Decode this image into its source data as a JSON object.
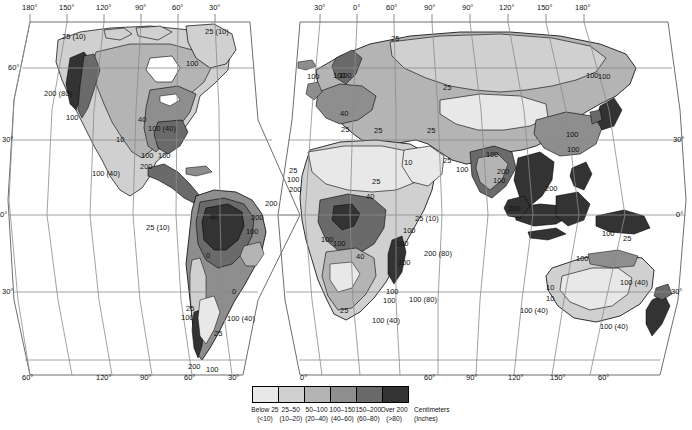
{
  "map": {
    "title": "World Average Annual Precipitation",
    "projection": "interrupted-goode-homolosine",
    "frame_color": "#7a7a7a",
    "graticule_color": "#8a8a8a",
    "coast_color": "#000000",
    "background": "#ffffff"
  },
  "graticule": {
    "top_left_lon": [
      "180°",
      "150°",
      "120°",
      "90°",
      "60°",
      "30°"
    ],
    "top_right_lon": [
      "30°",
      "0°",
      "60°",
      "90°",
      "90°",
      "120°",
      "150°",
      "180°"
    ],
    "bottom_left_lon": [
      "60°",
      "120°",
      "90°",
      "60°",
      "30°",
      "0°"
    ],
    "bottom_right_lon": [
      "60°",
      "90°",
      "120°",
      "150°",
      "60°"
    ],
    "left_lat": [
      "60°",
      "30°",
      "0°",
      "30°",
      "60°"
    ],
    "right_lat": [
      "30°",
      "0°",
      "30°"
    ]
  },
  "contour_labels": [
    {
      "text": "25 (10)",
      "x": 62,
      "y": 33
    },
    {
      "text": "25 (10)",
      "x": 205,
      "y": 28
    },
    {
      "text": "100",
      "x": 186,
      "y": 60
    },
    {
      "text": "200 (80)",
      "x": 44,
      "y": 90
    },
    {
      "text": "100",
      "x": 66,
      "y": 114
    },
    {
      "text": "40",
      "x": 138,
      "y": 116
    },
    {
      "text": "10",
      "x": 116,
      "y": 136
    },
    {
      "text": "100 (40)",
      "x": 148,
      "y": 125
    },
    {
      "text": "100",
      "x": 141,
      "y": 152
    },
    {
      "text": "200",
      "x": 140,
      "y": 163
    },
    {
      "text": "100",
      "x": 158,
      "y": 152
    },
    {
      "text": "100 (40)",
      "x": 92,
      "y": 170
    },
    {
      "text": "25 (10)",
      "x": 146,
      "y": 224
    },
    {
      "text": "80",
      "x": 210,
      "y": 213
    },
    {
      "text": "200",
      "x": 251,
      "y": 214
    },
    {
      "text": "100",
      "x": 246,
      "y": 228
    },
    {
      "text": "0",
      "x": 206,
      "y": 252
    },
    {
      "text": "0",
      "x": 232,
      "y": 288
    },
    {
      "text": "25",
      "x": 186,
      "y": 305
    },
    {
      "text": "100",
      "x": 181,
      "y": 314
    },
    {
      "text": "100 (40)",
      "x": 227,
      "y": 315
    },
    {
      "text": "25",
      "x": 214,
      "y": 330
    },
    {
      "text": "200",
      "x": 188,
      "y": 363
    },
    {
      "text": "100",
      "x": 206,
      "y": 366
    },
    {
      "text": "25",
      "x": 391,
      "y": 35
    },
    {
      "text": "100",
      "x": 333,
      "y": 72
    },
    {
      "text": "100",
      "x": 339,
      "y": 72
    },
    {
      "text": "100",
      "x": 307,
      "y": 73
    },
    {
      "text": "25",
      "x": 443,
      "y": 84
    },
    {
      "text": "40",
      "x": 340,
      "y": 110
    },
    {
      "text": "25",
      "x": 341,
      "y": 126
    },
    {
      "text": "25",
      "x": 374,
      "y": 127
    },
    {
      "text": "25",
      "x": 427,
      "y": 127
    },
    {
      "text": "25",
      "x": 443,
      "y": 157
    },
    {
      "text": "100",
      "x": 456,
      "y": 166
    },
    {
      "text": "10",
      "x": 404,
      "y": 159
    },
    {
      "text": "25",
      "x": 372,
      "y": 178
    },
    {
      "text": "25",
      "x": 289,
      "y": 167
    },
    {
      "text": "100",
      "x": 287,
      "y": 176
    },
    {
      "text": "200",
      "x": 289,
      "y": 186
    },
    {
      "text": "200",
      "x": 265,
      "y": 200
    },
    {
      "text": "100",
      "x": 321,
      "y": 236
    },
    {
      "text": "100",
      "x": 333,
      "y": 240
    },
    {
      "text": "40",
      "x": 366,
      "y": 193
    },
    {
      "text": "25 (10)",
      "x": 415,
      "y": 215
    },
    {
      "text": "100",
      "x": 403,
      "y": 227
    },
    {
      "text": "100",
      "x": 396,
      "y": 240
    },
    {
      "text": "200 (80)",
      "x": 424,
      "y": 250
    },
    {
      "text": "100",
      "x": 398,
      "y": 259
    },
    {
      "text": "40",
      "x": 356,
      "y": 253
    },
    {
      "text": "100",
      "x": 386,
      "y": 288
    },
    {
      "text": "100",
      "x": 383,
      "y": 297
    },
    {
      "text": "100 (80)",
      "x": 409,
      "y": 296
    },
    {
      "text": "25",
      "x": 340,
      "y": 307
    },
    {
      "text": "100 (40)",
      "x": 372,
      "y": 317
    },
    {
      "text": "100",
      "x": 586,
      "y": 72
    },
    {
      "text": "100",
      "x": 598,
      "y": 73
    },
    {
      "text": "100",
      "x": 566,
      "y": 131
    },
    {
      "text": "100",
      "x": 567,
      "y": 146
    },
    {
      "text": "100",
      "x": 486,
      "y": 151
    },
    {
      "text": "200",
      "x": 497,
      "y": 168
    },
    {
      "text": "100",
      "x": 493,
      "y": 177
    },
    {
      "text": "200",
      "x": 545,
      "y": 185
    },
    {
      "text": "200",
      "x": 508,
      "y": 205
    },
    {
      "text": "100",
      "x": 602,
      "y": 230
    },
    {
      "text": "25",
      "x": 623,
      "y": 235
    },
    {
      "text": "100",
      "x": 576,
      "y": 255
    },
    {
      "text": "10",
      "x": 546,
      "y": 284
    },
    {
      "text": "10",
      "x": 546,
      "y": 295
    },
    {
      "text": "100 (40)",
      "x": 620,
      "y": 279
    },
    {
      "text": "100 (40)",
      "x": 520,
      "y": 307
    },
    {
      "text": "100 (40)",
      "x": 600,
      "y": 323
    }
  ],
  "legend": {
    "classes": [
      {
        "range_cm": "Below 25",
        "range_in": "(<10)",
        "color": "#e8e8e8"
      },
      {
        "range_cm": "25–50",
        "range_in": "(10–20)",
        "color": "#d0d0d0"
      },
      {
        "range_cm": "50–100",
        "range_in": "(20–40)",
        "color": "#b4b4b4"
      },
      {
        "range_cm": "100–150",
        "range_in": "(40–60)",
        "color": "#8e8e8e"
      },
      {
        "range_cm": "150–200",
        "range_in": "(60–80)",
        "color": "#6a6a6a"
      },
      {
        "range_cm": "Over 200",
        "range_in": "(>80)",
        "color": "#333333"
      }
    ],
    "unit_primary": "Centimeters",
    "unit_secondary": "(Inches)"
  },
  "chart_data": {
    "type": "heatmap",
    "xlabel": "Longitude",
    "ylabel": "Latitude",
    "legend_position": "bottom-center",
    "grid": true,
    "categories": [
      "Below 25",
      "25–50",
      "50–100",
      "100–150",
      "150–200",
      "Over 200"
    ],
    "values": [
      10,
      20,
      40,
      60,
      80,
      100
    ],
    "units": "Centimeters (Inches)",
    "colors": [
      "#e8e8e8",
      "#d0d0d0",
      "#b4b4b4",
      "#8e8e8e",
      "#6a6a6a",
      "#333333"
    ]
  }
}
